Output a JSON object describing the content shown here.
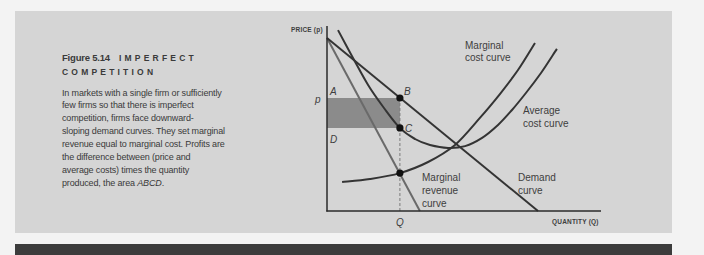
{
  "caption": {
    "figure_number": "Figure 5.14",
    "title_line1": "IMPERFECT",
    "title_line2": "COMPETITION",
    "body_lines": [
      "In markets with a single firm or sufficiently",
      "few firms so that there is imperfect",
      "competition, firms face downward-",
      "sloping demand curves. They set marginal",
      "revenue equal to marginal cost. Profits are",
      "the difference between (price and",
      "average costs) times the quantity"
    ],
    "body_last_prefix": "produced, the area ",
    "body_last_italic": "ABCD",
    "body_last_suffix": "."
  },
  "colors": {
    "panel_bg": "#d5d5d5",
    "shaded_area": "#8b8b8b",
    "curve_dark": "#343434",
    "curve_mr": "#6a6a6a",
    "bottom_bar": "#3c3c3c"
  },
  "chart_data": {
    "type": "line",
    "title": "Imperfect Competition",
    "xlabel": "QUANTITY (Q)",
    "ylabel": "PRICE (p)",
    "xlim": [
      0,
      100
    ],
    "ylim": [
      0,
      100
    ],
    "grid": false,
    "legend": "none (curves labeled inline)",
    "series": [
      {
        "name": "Demand curve",
        "label_lines": [
          "Demand",
          "curve"
        ],
        "points": [
          [
            0,
            93.5
          ],
          [
            77.0,
            0
          ]
        ]
      },
      {
        "name": "Marginal revenue curve",
        "label_lines": [
          "Marginal",
          "revenue",
          "curve"
        ],
        "points": [
          [
            0,
            93.5
          ],
          [
            33.9,
            0
          ]
        ]
      },
      {
        "name": "Marginal cost curve",
        "label_lines": [
          "Marginal",
          "cost curve"
        ],
        "points": [
          [
            5.5,
            15.7
          ],
          [
            15.7,
            17.3
          ],
          [
            26.6,
            20.5
          ],
          [
            36.9,
            26.5
          ],
          [
            46.7,
            35.7
          ],
          [
            55.8,
            50.3
          ],
          [
            63.1,
            63.2
          ],
          [
            69.7,
            76.2
          ],
          [
            75.9,
            90.8
          ]
        ]
      },
      {
        "name": "Average cost curve",
        "label_lines": [
          "Average",
          "cost curve"
        ],
        "points": [
          [
            4.0,
            97.8
          ],
          [
            9.1,
            83.8
          ],
          [
            15.0,
            68.1
          ],
          [
            20.8,
            55.7
          ],
          [
            26.6,
            44.9
          ],
          [
            32.1,
            38.9
          ],
          [
            37.6,
            35.7
          ],
          [
            44.2,
            34.1
          ],
          [
            50.4,
            35.1
          ],
          [
            56.6,
            39.5
          ],
          [
            62.4,
            46.5
          ],
          [
            67.5,
            54.6
          ],
          [
            72.6,
            63.8
          ],
          [
            78.1,
            74.6
          ],
          [
            83.9,
            87.6
          ]
        ]
      }
    ],
    "marked_points": [
      {
        "label": "B",
        "x": 26.6,
        "y": 61.1
      },
      {
        "label": "C",
        "x": 26.6,
        "y": 44.9
      },
      {
        "label": "",
        "x": 26.6,
        "y": 20.5
      }
    ],
    "corner_labels": {
      "A": "A",
      "D": "D"
    },
    "shaded_region": {
      "label": "ABCD",
      "x": [
        0,
        26.6
      ],
      "y": [
        44.9,
        61.1
      ]
    },
    "axis_markers": {
      "p_label": "p",
      "p_value": 61.1,
      "q_label": "Q",
      "q_value": 26.6
    }
  }
}
